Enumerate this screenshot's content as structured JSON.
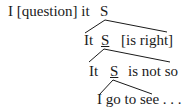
{
  "diagram": {
    "type": "syntax-tree",
    "rows": [
      {
        "prefix": "I [question] it",
        "node": "S"
      },
      {
        "prefix": "It",
        "node": "S",
        "suffix": "[is right]"
      },
      {
        "prefix": "It",
        "node": "S",
        "suffix": "is not so"
      },
      {
        "text": "I go to see . . ."
      }
    ],
    "edges": [
      {
        "from": "row0.S",
        "to": "row1 span",
        "description": "S expands to It S [is right]"
      },
      {
        "from": "row1.S",
        "to": "row2 span",
        "description": "S expands to It S is not so"
      },
      {
        "from": "row2.S",
        "to": "row3 span",
        "description": "S expands to I go to see . . ."
      }
    ],
    "line_color": "#1a1a1a"
  }
}
